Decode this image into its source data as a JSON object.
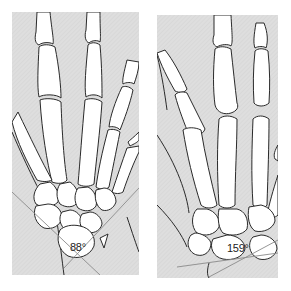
{
  "figure": {
    "panels": [
      {
        "id": "left",
        "description": "Hand skeleton, dorsal view with carpal angle measurement",
        "angle_label": "88°"
      },
      {
        "id": "right",
        "description": "Hand skeleton, dorsal view with widened carpal angle measurement",
        "angle_label": "159°"
      }
    ],
    "colors": {
      "background": "#ffffff",
      "panel_fill": "#dcdcdc",
      "bone_fill": "#ffffff",
      "outline": "#2a2a2a",
      "angle_line": "#8a8a8a"
    }
  }
}
